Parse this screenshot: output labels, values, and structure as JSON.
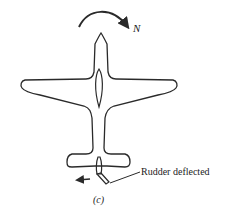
{
  "figure": {
    "moment_label": "N",
    "rudder_label": "Rudder deflected",
    "caption": "(c)",
    "colors": {
      "stroke": "#2a2a2a",
      "background": "#ffffff"
    }
  }
}
